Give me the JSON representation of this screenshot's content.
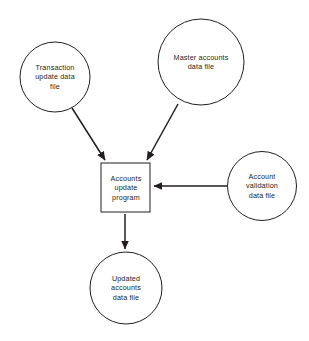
{
  "diagram": {
    "background_color": "#ffffff",
    "stroke_color": "#231f20",
    "fill_color": "#ffffff",
    "nodes": [
      {
        "id": "transaction-update-data-file",
        "shape": "circle",
        "label": "Transaction\nupdate data\nfile",
        "cx": 55,
        "cy": 77,
        "r": 35
      },
      {
        "id": "master-accounts-data-file",
        "shape": "circle",
        "label": "Master accounts\ndata file",
        "cx": 201,
        "cy": 62,
        "r": 43
      },
      {
        "id": "accounts-update-program",
        "shape": "rectangle",
        "label": "Accounts\nupdate\nprogram",
        "x": 101,
        "y": 163,
        "width": 49,
        "height": 49
      },
      {
        "id": "account-validation-data-file",
        "shape": "circle",
        "label": "Account\nvalidation\ndata file",
        "cx": 262,
        "cy": 186,
        "r": 34.5
      },
      {
        "id": "updated-accounts-data-file",
        "shape": "circle",
        "label": "Updated\naccounts\ndata file",
        "cx": 126,
        "cy": 288,
        "r": 36
      }
    ],
    "edges": [
      {
        "id": "transaction-to-program",
        "from": "transaction-update-data-file",
        "to": "accounts-update-program",
        "direction": "down-right",
        "x1": 72,
        "y1": 108,
        "x2": 105,
        "y2": 160
      },
      {
        "id": "master-to-program",
        "from": "master-accounts-data-file",
        "to": "accounts-update-program",
        "direction": "down-left",
        "x1": 178,
        "y1": 104,
        "x2": 147,
        "y2": 160
      },
      {
        "id": "validation-to-program",
        "from": "account-validation-data-file",
        "to": "accounts-update-program",
        "direction": "left",
        "x1": 227,
        "y1": 186,
        "x2": 153,
        "y2": 186
      },
      {
        "id": "program-to-updated",
        "from": "accounts-update-program",
        "to": "updated-accounts-data-file",
        "direction": "down",
        "x1": 125,
        "y1": 214,
        "x2": 125,
        "y2": 249
      }
    ]
  }
}
